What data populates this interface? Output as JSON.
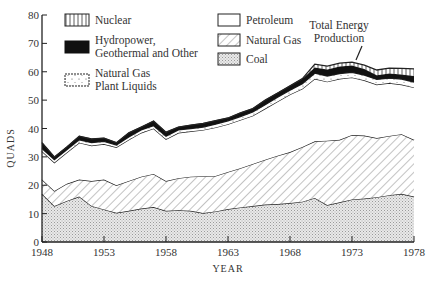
{
  "chart_data": {
    "type": "area",
    "stacked": true,
    "title": "",
    "xlabel": "YEAR",
    "ylabel": "QUADS",
    "xlim": [
      1948,
      1978
    ],
    "ylim": [
      0,
      80
    ],
    "x_ticks": [
      "1948",
      "1953",
      "1958",
      "1963",
      "1968",
      "1973",
      "1978"
    ],
    "y_ticks": [
      "0",
      "10",
      "20",
      "30",
      "40",
      "50",
      "60",
      "70",
      "80"
    ],
    "grid": false,
    "legend_position": "top-left, two columns inside plot",
    "annotation": {
      "text_line1": "Total Energy",
      "text_line2": "Production",
      "points_to_year": 1973
    },
    "x": [
      1948,
      1949,
      1950,
      1951,
      1952,
      1953,
      1954,
      1955,
      1956,
      1957,
      1958,
      1959,
      1960,
      1961,
      1962,
      1963,
      1964,
      1965,
      1966,
      1967,
      1968,
      1969,
      1970,
      1971,
      1972,
      1973,
      1974,
      1975,
      1976,
      1977,
      1978
    ],
    "series": [
      {
        "name": "Coal",
        "pattern": "dotted-gray",
        "cumulative_top": [
          17,
          12.7,
          14.5,
          16,
          12.7,
          11.5,
          10.3,
          11,
          11.8,
          12.3,
          11,
          11.2,
          11,
          10.2,
          10.8,
          11.6,
          12.2,
          12.7,
          13.2,
          13.4,
          13.7,
          14.2,
          15.5,
          13,
          14,
          15,
          15.3,
          15.8,
          16.5,
          17,
          16
        ]
      },
      {
        "name": "Natural Gas",
        "pattern": "diagonal-hatch",
        "cumulative_top": [
          22,
          18,
          20.5,
          22,
          21.5,
          22,
          20,
          21.5,
          23,
          24,
          21.5,
          22.5,
          23,
          23.2,
          23.3,
          24.7,
          26,
          27.5,
          29,
          30.4,
          31.7,
          33.5,
          35.5,
          35.7,
          36,
          37.7,
          37.5,
          36.6,
          37.4,
          38,
          36
        ]
      },
      {
        "name": "Petroleum",
        "pattern": "white",
        "cumulative_top": [
          32,
          28,
          31.5,
          35,
          34,
          34.5,
          33.4,
          36,
          38.5,
          40,
          36.2,
          38.5,
          39,
          39.5,
          40.4,
          41.5,
          43,
          44.5,
          47,
          49.5,
          52,
          54,
          57.5,
          56.5,
          57.5,
          58,
          57,
          55.5,
          56,
          55.5,
          54.5
        ]
      },
      {
        "name": "Natural Gas Plant Liquids",
        "pattern": "sparse-dots",
        "cumulative_top": [
          33,
          29,
          32.5,
          36,
          35,
          35.5,
          34.2,
          37,
          39.5,
          41,
          37.3,
          39.5,
          40,
          40.5,
          41.5,
          42.7,
          44.2,
          45.8,
          48.4,
          51,
          53.5,
          55.8,
          59.5,
          58.5,
          59.4,
          59.8,
          58.8,
          57.3,
          57.8,
          57.4,
          56.4
        ]
      },
      {
        "name": "Hydropower, Geothermal and Other",
        "pattern": "solid-black",
        "cumulative_top": [
          35,
          30,
          33.5,
          37.3,
          36.3,
          36.6,
          35,
          38.5,
          40.5,
          42.6,
          38.7,
          40.5,
          41.2,
          41.8,
          42.8,
          43.7,
          45.5,
          47,
          50,
          52.5,
          55,
          57.5,
          61.5,
          60.8,
          61.8,
          62.2,
          61,
          58.8,
          59.4,
          59,
          58.5
        ]
      },
      {
        "name": "Nuclear",
        "pattern": "vertical-lines",
        "cumulative_top": [
          35,
          30,
          33.5,
          37.3,
          36.3,
          36.6,
          35,
          38.5,
          40.5,
          42.6,
          38.7,
          40.5,
          41.2,
          41.8,
          42.8,
          43.7,
          45.5,
          47,
          50,
          52.5,
          55,
          57.6,
          62.7,
          62,
          63,
          63.4,
          62.3,
          60.6,
          61.3,
          61.2,
          61
        ]
      }
    ]
  },
  "legend": {
    "nuclear": "Nuclear",
    "hydro_line1": "Hydropower,",
    "hydro_line2": "Geothermal and Other",
    "ngpl_line1": "Natural Gas",
    "ngpl_line2": "Plant Liquids",
    "petroleum": "Petroleum",
    "natural_gas": "Natural Gas",
    "coal": "Coal"
  },
  "axes": {
    "x_title": "YEAR",
    "y_title": "QUADS",
    "x_ticks": [
      "1948",
      "1953",
      "1958",
      "1963",
      "1968",
      "1973",
      "1978"
    ],
    "y_ticks": [
      "0",
      "10",
      "20",
      "30",
      "40",
      "50",
      "60",
      "70",
      "80"
    ]
  },
  "annotation": {
    "line1": "Total Energy",
    "line2": "Production"
  }
}
